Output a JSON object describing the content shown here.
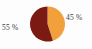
{
  "chart_data": {
    "type": "pie",
    "title": "",
    "subtitle": "",
    "xlabel": "",
    "ylabel": "",
    "legend_position": "none",
    "grid": false,
    "units": "percent",
    "start_angle_deg": 0,
    "direction": "clockwise",
    "categories": [
      "45 %",
      "55 %"
    ],
    "values": [
      45,
      55
    ],
    "slices": [
      {
        "label": "45 %",
        "value": 45,
        "color": "#F2A03C",
        "start_angle_deg": 0,
        "sweep_angle_deg": 162,
        "label_position": "right"
      },
      {
        "label": "55 %",
        "value": 55,
        "color": "#7A1A12",
        "start_angle_deg": 162,
        "sweep_angle_deg": 198,
        "label_position": "left"
      }
    ],
    "labels": {
      "left": "55 %",
      "right": "45 %"
    },
    "colors": {
      "slice_orange": "#F2A03C",
      "slice_maroon": "#7A1A12",
      "label_text": "#3a3a3a",
      "background": "#fdfdfd"
    },
    "geometry": {
      "center_x": 47.5,
      "center_y": 24.0,
      "radius": 17.5
    }
  }
}
